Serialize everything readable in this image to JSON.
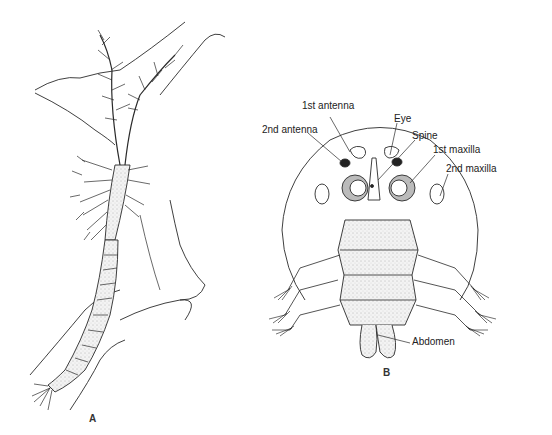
{
  "figure": {
    "panels": [
      {
        "id": "A",
        "label": "A"
      },
      {
        "id": "B",
        "label": "B"
      }
    ],
    "annotations": {
      "first_antenna": "1st antenna",
      "second_antenna": "2nd antenna",
      "eye": "Eye",
      "spine": "Spine",
      "first_maxilla": "1st maxilla",
      "second_maxilla": "2nd maxilla",
      "abdomen": "Abdomen"
    },
    "colors": {
      "line": "#2a2a2a",
      "stipple": "#d8d8d8",
      "background": "#ffffff"
    }
  }
}
